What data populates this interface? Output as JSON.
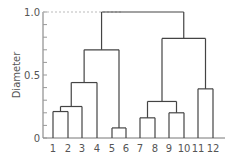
{
  "chart_data": {
    "type": "dendrogram",
    "title": "",
    "xlabel": "",
    "ylabel": "Diameter",
    "ylim": [
      0,
      1.0
    ],
    "yticks_labeled": [
      "0",
      "0.5",
      "1.0"
    ],
    "minor_tick_step": 0.1,
    "leaves": [
      "1",
      "2",
      "3",
      "4",
      "5",
      "6",
      "7",
      "8",
      "9",
      "10",
      "11",
      "12"
    ],
    "merges": [
      {
        "left": "1",
        "right": "2",
        "height": 0.21
      },
      {
        "left": "(1,2)",
        "right": "3",
        "height": 0.25
      },
      {
        "left": "((1,2),3)",
        "right": "4",
        "height": 0.44
      },
      {
        "left": "5",
        "right": "6",
        "height": 0.08
      },
      {
        "left": "(((1,2),3),4)",
        "right": "(5,6)",
        "height": 0.7
      },
      {
        "left": "7",
        "right": "8",
        "height": 0.16
      },
      {
        "left": "9",
        "right": "10",
        "height": 0.2
      },
      {
        "left": "(7,8)",
        "right": "(9,10)",
        "height": 0.29
      },
      {
        "left": "11",
        "right": "12",
        "height": 0.39
      },
      {
        "left": "((7,8),(9,10))",
        "right": "(11,12)",
        "height": 0.79
      },
      {
        "left": "left_cluster",
        "right": "right_cluster",
        "height": 1.0
      }
    ],
    "reference_line": {
      "y": 1.0,
      "style": "dashed"
    }
  },
  "axis": {
    "ylabel": "Diameter",
    "tick_labels": {
      "t0": "0",
      "t05": "0.5",
      "t10": "1.0"
    },
    "leaf_labels": [
      "1",
      "2",
      "3",
      "4",
      "5",
      "6",
      "7",
      "8",
      "9",
      "10",
      "11",
      "12"
    ]
  }
}
